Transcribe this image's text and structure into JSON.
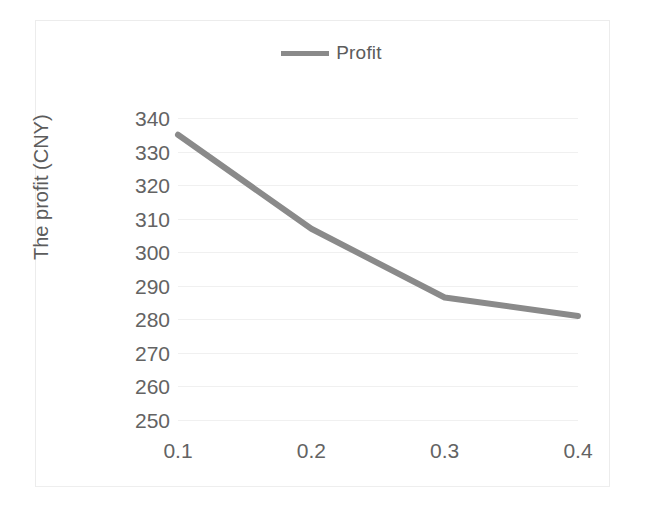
{
  "chart_data": {
    "type": "line",
    "title": "",
    "subtitle": "",
    "xlabel": "",
    "ylabel": "The profit (CNY)",
    "x": [
      0.1,
      0.2,
      0.3,
      0.4
    ],
    "x_tick_labels": [
      "0.1",
      "0.2",
      "0.3",
      "0.4"
    ],
    "y_tick_labels": [
      "340",
      "330",
      "320",
      "310",
      "300",
      "290",
      "280",
      "270",
      "260",
      "250"
    ],
    "y_ticks": [
      340,
      330,
      320,
      310,
      300,
      290,
      280,
      270,
      260,
      250
    ],
    "ylim": [
      250,
      340
    ],
    "xlim": [
      0.1,
      0.4
    ],
    "grid": "horizontal",
    "legend_position": "top-center",
    "series": [
      {
        "name": "Profit",
        "values": [
          335,
          307,
          286.5,
          281
        ],
        "color": "#8a8a8a",
        "line_width": 6,
        "markers": false
      }
    ],
    "annotations": []
  },
  "legend": {
    "entries": [
      {
        "label": "Profit",
        "swatch_color": "#8a8a8a"
      }
    ]
  },
  "axes": {
    "y_title": "The profit (CNY)",
    "x_title": ""
  },
  "colors": {
    "series_gray": "#8a8a8a",
    "tick_text": "#636363",
    "gridline": "#f0f0f0",
    "frame": "#ececec",
    "background": "#ffffff"
  }
}
